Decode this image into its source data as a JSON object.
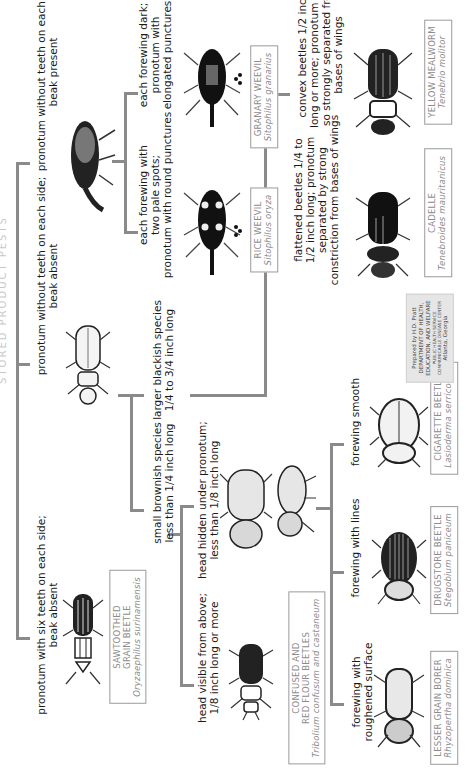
{
  "title_fragment": "STORED PRODUCT PESTS",
  "key_steps": {
    "pronotum_six_teeth": [
      "pronotum with six teeth on each side;",
      "beak absent"
    ],
    "pronotum_no_teeth_beak_absent": [
      "pronotum without teeth on each side;",
      "beak absent"
    ],
    "pronotum_no_teeth_beak_present": [
      "pronotum without teeth on each side;",
      "beak present"
    ],
    "two_pale_spots": [
      "each forewing with",
      "two pale spots;",
      "pronotum with round punctures"
    ],
    "forewing_dark": [
      "each forewing dark;",
      "pronotum with",
      "elongated punctures"
    ],
    "small_brownish": [
      "small brownish species",
      "less than 1/4 inch long"
    ],
    "larger_blackish": [
      "larger blackish species",
      "1/4 to 3/4 inch long"
    ],
    "head_visible": [
      "head visible from above;",
      "1/8 inch long or more"
    ],
    "head_hidden": [
      "head hidden under pronotum;",
      "less than 1/8 inch long"
    ],
    "flattened": [
      "flattened beetles 1/4 to",
      "1/2 inch long; pronotum",
      "separated by strong",
      "constriction from bases of wings"
    ],
    "convex": [
      "convex beetles 1/2 inch",
      "long or more; pronotum not",
      "so strongly separated from",
      "bases of wings"
    ],
    "roughened": [
      "forewing with",
      "roughened surface"
    ],
    "lines": [
      "forewing with lines"
    ],
    "smooth": [
      "forewing smooth"
    ]
  },
  "species": {
    "sawtoothed": {
      "common": [
        "SAWTOOTHED",
        "GRAIN BEETLE"
      ],
      "scientific": "Oryzaephilus surinamensis"
    },
    "rice_weevil": {
      "common": [
        "RICE WEEVIL"
      ],
      "scientific": "Sitophilus oryza"
    },
    "granary_weevil": {
      "common": [
        "GRANARY WEEVIL"
      ],
      "scientific": "Sitophilus granarius"
    },
    "flour_beetles": {
      "common": [
        "CONFUSED AND",
        "RED FLOUR BEETLES"
      ],
      "scientific": "Tribolium confusum and castaneum"
    },
    "cadelle": {
      "common": [
        "CADELLE"
      ],
      "scientific": "Tenebroides mauritanicus"
    },
    "mealworm": {
      "common": [
        "YELLOW MEALWORM"
      ],
      "scientific": "Tenebrio molitor"
    },
    "lesser_grain_borer": {
      "common": [
        "LESSER GRAIN BORER"
      ],
      "scientific": "Rhyzopertha dominica"
    },
    "drugstore": {
      "common": [
        "DRUGSTORE BEETLE"
      ],
      "scientific": "Stegobium paniceum"
    },
    "cigarette": {
      "common": [
        "CIGARETTE BEETLE"
      ],
      "scientific": "Lasioderma serricorne"
    }
  },
  "credit": {
    "lines": [
      "Prepared by H.D. Pratt",
      "DEPARTMENT OF HEALTH,",
      "EDUCATION, AND WELFARE"
    ],
    "small_lines": [
      "PUBLIC HEALTH SERVICE",
      "COMMUNICABLE DISEASE CENTER"
    ],
    "location": "Atlanta, Georgia"
  },
  "colors": {
    "line": "#8a8a8a",
    "label_text": "#8c8c8c",
    "credit_bg": "#e6e6e6"
  }
}
